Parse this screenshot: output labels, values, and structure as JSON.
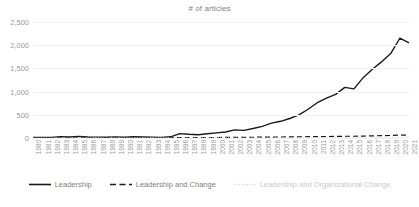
{
  "chart_data": {
    "type": "line",
    "title": "# of articles",
    "xlabel": "",
    "ylabel": "",
    "ylim": [
      0,
      2500
    ],
    "yticks": [
      "0",
      "500",
      "1,000",
      "1,500",
      "2,000",
      "2,500"
    ],
    "ytick_values": [
      0,
      500,
      1000,
      1500,
      2000,
      2500
    ],
    "grid": true,
    "legend_position": "bottom",
    "categories": [
      "1980",
      "1981",
      "1982",
      "1983",
      "1984",
      "1985",
      "1986",
      "1987",
      "1988",
      "1989",
      "1990",
      "1991",
      "1992",
      "1993",
      "1994",
      "1995",
      "1996",
      "1997",
      "1998",
      "1999",
      "2000",
      "2001",
      "2002",
      "2003",
      "2004",
      "2005",
      "2006",
      "2007",
      "2008",
      "2009",
      "2010",
      "2011",
      "2012",
      "2013",
      "2014",
      "2015",
      "2016",
      "2017",
      "2018",
      "2019",
      "2020",
      "2021"
    ],
    "series": [
      {
        "name": "Leadership",
        "style": "solid",
        "color": "#1a1a1a",
        "values": [
          12,
          10,
          14,
          30,
          22,
          34,
          20,
          18,
          16,
          24,
          16,
          28,
          22,
          18,
          14,
          26,
          95,
          80,
          70,
          90,
          110,
          130,
          175,
          165,
          205,
          250,
          320,
          360,
          420,
          500,
          620,
          760,
          860,
          940,
          1090,
          1060,
          1300,
          1480,
          1640,
          1820,
          2150,
          2050
        ]
      },
      {
        "name": "Leadership and Change",
        "style": "dashed",
        "color": "#1a1a1a",
        "values": [
          2,
          2,
          3,
          4,
          3,
          5,
          4,
          4,
          3,
          5,
          4,
          6,
          5,
          4,
          4,
          6,
          8,
          8,
          9,
          10,
          11,
          12,
          14,
          14,
          16,
          18,
          20,
          22,
          24,
          26,
          28,
          30,
          32,
          34,
          38,
          38,
          42,
          46,
          50,
          54,
          62,
          60
        ]
      },
      {
        "name": "Leadership and Organizational Change",
        "style": "dotted",
        "color": "#d9d9d9",
        "values": [
          0,
          0,
          0,
          0,
          0,
          1,
          0,
          1,
          0,
          1,
          1,
          1,
          1,
          1,
          1,
          1,
          2,
          2,
          2,
          2,
          3,
          3,
          3,
          3,
          4,
          4,
          5,
          5,
          5,
          6,
          6,
          7,
          7,
          8,
          8,
          8,
          9,
          10,
          10,
          11,
          13,
          12
        ]
      }
    ]
  },
  "legend": {
    "items": [
      {
        "label": "Leadership"
      },
      {
        "label": "Leadership and Change"
      },
      {
        "label": "Leadership and Organizational Change"
      }
    ]
  }
}
